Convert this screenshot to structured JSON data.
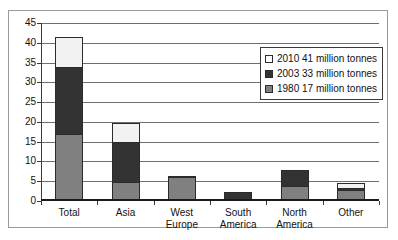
{
  "chart_data": {
    "type": "bar",
    "stacked": true,
    "title": "",
    "xlabel": "",
    "ylabel": "",
    "ylim": [
      0,
      45
    ],
    "ytick_step": 5,
    "yticks": [
      0,
      5,
      10,
      15,
      20,
      25,
      30,
      35,
      40,
      45
    ],
    "grid": true,
    "legend_position": "top-right",
    "categories": [
      "Total",
      "Asia",
      "West\nEurope",
      "South\nAmerica",
      "North\nAmerica",
      "Other"
    ],
    "series": [
      {
        "name": "1980 17 million tonnes",
        "color": "#808080",
        "values": [
          17.0,
          4.8,
          6.0,
          0.0,
          3.8,
          2.8
        ]
      },
      {
        "name": "2003 33 million tonnes",
        "color": "#333333",
        "values": [
          17.0,
          10.0,
          0.4,
          2.4,
          4.0,
          0.5
        ]
      },
      {
        "name": "2010 41 million tonnes",
        "color": "#f2f2f2",
        "values": [
          7.5,
          5.0,
          0.0,
          0.0,
          0.0,
          1.3
        ]
      }
    ],
    "cumulative_totals": [
      41.5,
      19.8,
      6.4,
      2.4,
      7.8,
      4.6
    ],
    "legend": [
      {
        "label": "2010 41 million tonnes",
        "swatch": "#ffffff"
      },
      {
        "label": "2003 33 million tonnes",
        "swatch": "#333333"
      },
      {
        "label": "1980 17 million tonnes",
        "swatch": "#808080"
      }
    ]
  }
}
